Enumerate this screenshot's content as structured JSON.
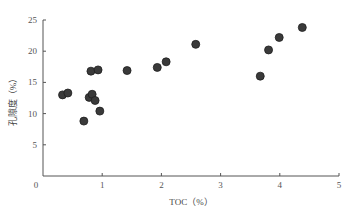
{
  "chart_data": {
    "type": "scatter",
    "title": "",
    "xlabel": "TOC（%）",
    "ylabel": "孔隙度（%）",
    "xlim": [
      0,
      5
    ],
    "ylim": [
      0,
      25
    ],
    "xticks": [
      0,
      1,
      2,
      3,
      4,
      5
    ],
    "yticks": [
      0,
      5,
      10,
      15,
      20,
      25
    ],
    "x_tick_labels": [
      "0",
      "1",
      "2",
      "3",
      "4",
      "5"
    ],
    "y_tick_labels": [
      "0",
      "5",
      "10",
      "15",
      "20",
      "25"
    ],
    "grid": false,
    "legend": null,
    "series": [
      {
        "name": "samples",
        "color": "#3a3a3a",
        "points": [
          {
            "x": 0.33,
            "y": 13.0
          },
          {
            "x": 0.42,
            "y": 13.3
          },
          {
            "x": 0.69,
            "y": 8.8
          },
          {
            "x": 0.78,
            "y": 12.6
          },
          {
            "x": 0.81,
            "y": 16.8
          },
          {
            "x": 0.83,
            "y": 13.1
          },
          {
            "x": 0.88,
            "y": 12.1
          },
          {
            "x": 0.93,
            "y": 17.0
          },
          {
            "x": 0.96,
            "y": 10.4
          },
          {
            "x": 1.42,
            "y": 16.9
          },
          {
            "x": 1.93,
            "y": 17.4
          },
          {
            "x": 2.08,
            "y": 18.3
          },
          {
            "x": 2.58,
            "y": 21.1
          },
          {
            "x": 3.67,
            "y": 16.0
          },
          {
            "x": 3.81,
            "y": 20.2
          },
          {
            "x": 3.99,
            "y": 22.2
          },
          {
            "x": 4.38,
            "y": 23.8
          }
        ]
      }
    ]
  },
  "layout": {
    "plot_left": 43,
    "plot_right": 339,
    "plot_top": 20,
    "plot_bottom": 176,
    "marker_radius": 4,
    "axis_color": "#555555",
    "marker_fill": "#3a3a3a",
    "marker_stroke": "#1e1e1e"
  }
}
